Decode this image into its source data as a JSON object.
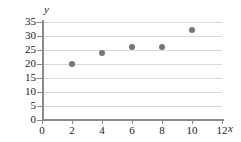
{
  "chart_data": {
    "type": "scatter",
    "title": "",
    "xlabel": "x",
    "ylabel": "y",
    "x": [
      2,
      4,
      6,
      8,
      10
    ],
    "values": [
      20,
      24,
      26,
      26,
      32
    ],
    "points": [
      {
        "x": 2,
        "y": 20
      },
      {
        "x": 4,
        "y": 24
      },
      {
        "x": 6,
        "y": 26
      },
      {
        "x": 8,
        "y": 26
      },
      {
        "x": 10,
        "y": 32
      }
    ],
    "xlim": [
      0,
      12
    ],
    "ylim": [
      0,
      35
    ],
    "xticks": [
      0,
      2,
      4,
      6,
      8,
      10,
      12
    ],
    "yticks": [
      0,
      5,
      10,
      15,
      20,
      25,
      30,
      35
    ],
    "xtick_labels": [
      "0",
      "2",
      "4",
      "6",
      "8",
      "10",
      "12"
    ],
    "ytick_labels": [
      "0",
      "5",
      "10",
      "15",
      "20",
      "25",
      "30",
      "35"
    ],
    "grid": "horizontal",
    "legend": null,
    "marker_color": "#767676",
    "grid_color": "#d9d9d9",
    "axis_color": "#8a8a8a"
  }
}
